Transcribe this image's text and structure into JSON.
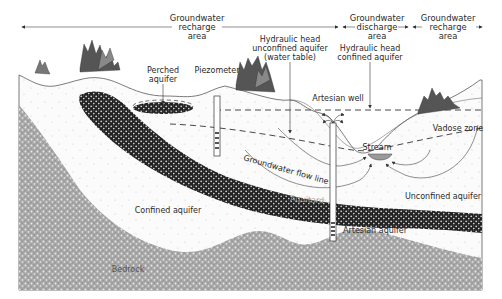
{
  "diagram": {
    "type": "groundwater cross-section",
    "zones_header": [
      {
        "label_lines": [
          "Groundwater",
          "recharge",
          "area"
        ]
      },
      {
        "label_lines": [
          "Groundwater",
          "discharge",
          "area"
        ]
      },
      {
        "label_lines": [
          "Groundwater",
          "recharge",
          "area"
        ]
      }
    ],
    "labels": {
      "perched_aquifer": [
        "Perched",
        "aquifer"
      ],
      "piezometer": "Piezometer",
      "hydraulic_head_unconfined": [
        "Hydraulic head",
        "unconfined aquifer",
        "(water table)"
      ],
      "hydraulic_head_confined": [
        "Hydraulic head",
        "confined aquifer"
      ],
      "artesian_well": "Artesian well",
      "vadose_zone": "Vadose zone",
      "stream": "Stream",
      "groundwater_flow_line": "Groundwater flow line",
      "aquitard": "Aquitard",
      "unconfined_aquifer": "Unconfined aquifer",
      "confined_aquifer": "Confined aquifer",
      "artesian_aquifer": "Artesian aquifer",
      "bedrock": "Bedrock"
    },
    "colors": {
      "background": "#ffffff",
      "line": "#333333",
      "stream": "#9a9a9a",
      "aquitard": "#2b2b2b",
      "bedrock": "#9c9c9c",
      "trees": "#4a4a4a"
    }
  }
}
